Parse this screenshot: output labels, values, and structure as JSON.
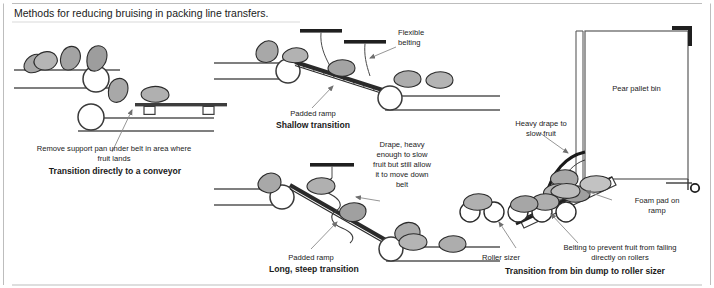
{
  "title": "Methods for reducing bruising in packing line transfers.",
  "panels": [
    {
      "id": "panel-conveyor",
      "caption": "Transition directly to a conveyor",
      "labels": [
        {
          "name": "remove-support-pan",
          "line1": "Remove support pan under belt in area where",
          "line2": "fruit lands"
        }
      ]
    },
    {
      "id": "panel-shallow",
      "caption": "Shallow transition",
      "labels": [
        {
          "name": "flexible-belting",
          "line1": "Flexible",
          "line2": "belting"
        },
        {
          "name": "padded-ramp",
          "line1": "Padded ramp"
        }
      ]
    },
    {
      "id": "panel-steep",
      "caption": "Long, steep transition",
      "labels": [
        {
          "name": "drape-note",
          "line1": "Drape, heavy",
          "line2": "enough to slow",
          "line3": "fruit but still allow",
          "line4": "it to move down",
          "line5": "belt"
        },
        {
          "name": "padded-ramp",
          "line1": "Padded ramp"
        }
      ]
    },
    {
      "id": "panel-bin-dump",
      "caption": "Transition from bin dump to roller sizer",
      "labels": [
        {
          "name": "pear-pallet-bin",
          "line1": "Pear pallet bin"
        },
        {
          "name": "heavy-drape",
          "line1": "Heavy drape to",
          "line2": "slow fruit"
        },
        {
          "name": "foam-pad",
          "line1": "Foam pad on",
          "line2": "ramp"
        },
        {
          "name": "belting-prevent",
          "line1": "Belting to prevent fruit from falling",
          "line2": "directly on rollers"
        },
        {
          "name": "roller-sizer",
          "line1": "Roller sizer"
        }
      ]
    }
  ],
  "colors": {
    "ink": "#1a1a1a",
    "line": "#555555",
    "fruit_fill": "#a8a8a8",
    "fruit_fill_light": "#c2c2c2",
    "fruit_stroke": "#2b2b2b",
    "bar_dark": "#222222",
    "leader": "#8a8a8a",
    "rule": "#bdbdbd"
  }
}
